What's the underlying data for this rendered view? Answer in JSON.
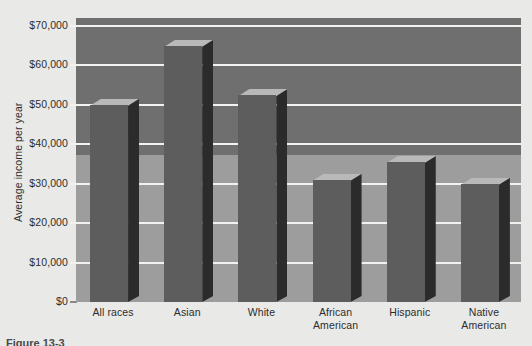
{
  "figure": {
    "caption": "Figure 13-3",
    "y_axis_title": "Average income per year"
  },
  "chart_data": {
    "type": "bar",
    "title": "",
    "xlabel": "",
    "ylabel": "Average income per year",
    "categories": [
      "All races",
      "Asian",
      "White",
      "African American",
      "Hispanic",
      "Native American"
    ],
    "category_lines": [
      [
        "All races",
        ""
      ],
      [
        "Asian",
        ""
      ],
      [
        "White",
        ""
      ],
      [
        "African",
        "American"
      ],
      [
        "Hispanic",
        ""
      ],
      [
        "Native",
        "American"
      ]
    ],
    "values": [
      50000,
      65000,
      52500,
      31000,
      35500,
      30000
    ],
    "ylim": [
      0,
      72000
    ],
    "ytick_values": [
      0,
      10000,
      20000,
      30000,
      40000,
      50000,
      60000,
      70000
    ],
    "ytick_labels": [
      "$0",
      "$10,000",
      "$20,000",
      "$30,000",
      "$40,000",
      "$50,000",
      "$60,000",
      "$70,000"
    ],
    "grid": true,
    "legend": "none",
    "style": "3d-columns",
    "colors": {
      "page_background": "#e9e9e7",
      "plot_background_upper": "#6f6f6f",
      "plot_background_lower": "#9d9d9d",
      "gridline": "#f2f2f0",
      "bar_front": "#5d5d5d",
      "bar_side": "#2b2b2b",
      "bar_top": "#b9b9b9",
      "text": "#2d2d2d"
    }
  }
}
